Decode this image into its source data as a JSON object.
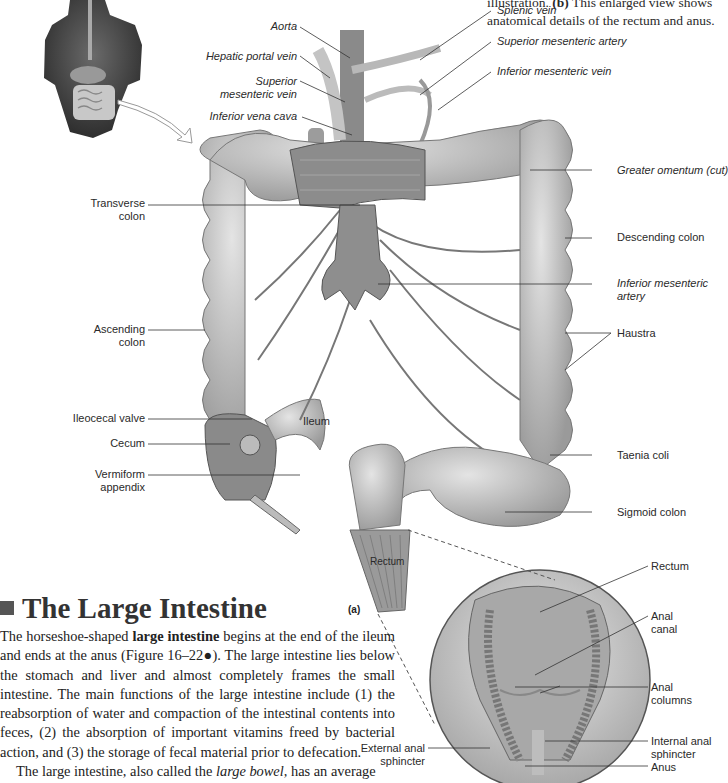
{
  "caption": {
    "prefix": "illustration. ",
    "part_b": "(b)",
    "text": " This enlarged view shows anatomical details of the rectum and anus."
  },
  "figure": {
    "panel_a_tag": "(a)",
    "labels_top": {
      "aorta": "Aorta",
      "hepatic_portal_vein": "Hepatic portal vein",
      "superior_mesenteric_vein_1": "Superior",
      "superior_mesenteric_vein_2": "mesenteric vein",
      "inferior_vena_cava": "Inferior vena cava",
      "splenic_vein": "Splenic vein",
      "superior_mesenteric_artery": "Superior mesenteric artery",
      "inferior_mesenteric_vein": "Inferior mesenteric vein"
    },
    "labels_right": {
      "greater_omentum": "Greater omentum (cut)",
      "descending_colon": "Descending colon",
      "inferior_mesenteric_artery_1": "Inferior mesenteric",
      "inferior_mesenteric_artery_2": "artery",
      "haustra": "Haustra",
      "taenia_coli": "Taenia coli",
      "sigmoid_colon": "Sigmoid colon"
    },
    "labels_left": {
      "transverse_colon_1": "Transverse",
      "transverse_colon_2": "colon",
      "ascending_colon_1": "Ascending",
      "ascending_colon_2": "colon",
      "ileocecal_valve": "Ileocecal valve",
      "cecum": "Cecum",
      "vermiform_appendix_1": "Vermiform",
      "vermiform_appendix_2": "appendix"
    },
    "labels_inner": {
      "ileum": "Ileum",
      "rectum_a": "Rectum"
    },
    "labels_detail": {
      "rectum": "Rectum",
      "anal_canal_1": "Anal",
      "anal_canal_2": "canal",
      "anal_columns_1": "Anal",
      "anal_columns_2": "columns",
      "internal_anal_sphincter_1": "Internal anal",
      "internal_anal_sphincter_2": "sphincter",
      "anus": "Anus",
      "external_anal_sphincter_1": "External anal",
      "external_anal_sphincter_2": "sphincter"
    }
  },
  "section": {
    "heading": "The Large Intestine",
    "p1_a": "The horseshoe-shaped ",
    "p1_bold": "large intestine",
    "p1_b": " begins at the end of the ileum and ends at the anus (Figure 16–22●). The large intestine lies below the stomach and liver and almost completely frames the small intestine. The main functions of the large intestine include (1) the reabsorption of water and compaction of the intestinal contents into feces, (2) the absorption of important vitamins freed by bacterial action, and (3) the storage of fecal material prior to defecation.",
    "p2_a": "The large intestine, also called the ",
    "p2_italic": "large bowel,",
    "p2_b": " has an average"
  }
}
